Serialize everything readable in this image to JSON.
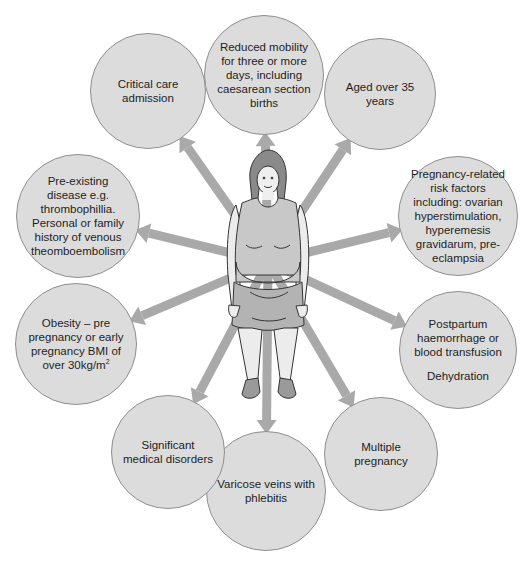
{
  "diagram": {
    "center_figure": "woman-figure",
    "colors": {
      "circle_fill": "#dcdcdc",
      "circle_border": "#8f8f8f",
      "arrow": "#a9a9a9",
      "text": "#1e1e1e"
    },
    "nodes": [
      {
        "id": "reduced-mobility",
        "label": "Reduced mobility for three or more days, including caesarean section births",
        "cx": 264,
        "cy": 75,
        "r": 60
      },
      {
        "id": "aged-over-35",
        "label": "Aged over 35 years",
        "cx": 380,
        "cy": 94,
        "r": 56
      },
      {
        "id": "pregnancy-related",
        "label": "Pregnancy-related risk factors including: ovarian hyperstimulation, hyperemesis gravidarum, pre-eclampsia",
        "cx": 458,
        "cy": 216,
        "r": 60
      },
      {
        "id": "postpartum",
        "label": "Postpartum haemorrhage or blood transfusion",
        "label2": "Dehydration",
        "cx": 458,
        "cy": 350,
        "r": 59
      },
      {
        "id": "multiple-pregnancy",
        "label": "Multiple pregnancy",
        "cx": 381,
        "cy": 454,
        "r": 57
      },
      {
        "id": "varicose-veins",
        "label": "Varicose veins with phlebitis",
        "cx": 266,
        "cy": 491,
        "r": 60
      },
      {
        "id": "significant-medical",
        "label": "Significant medical disorders",
        "cx": 168,
        "cy": 452,
        "r": 57
      },
      {
        "id": "obesity",
        "label": "Obesity – pre pregnancy or early pregnancy BMI of over 30kg/m",
        "sup": "2",
        "cx": 76,
        "cy": 344,
        "r": 61
      },
      {
        "id": "pre-existing-disease",
        "label": "Pre-existing disease e.g. thrombophillia. Personal or family history of venous theomboembolism",
        "cx": 78,
        "cy": 216,
        "r": 62
      },
      {
        "id": "critical-care",
        "label": "Critical care admission",
        "cx": 148,
        "cy": 91,
        "r": 58
      }
    ]
  }
}
